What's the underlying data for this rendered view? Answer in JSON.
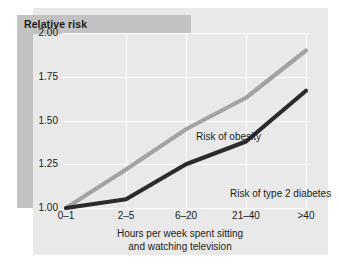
{
  "figure": {
    "title": "Relative risk",
    "background_color": "#ffffff",
    "panel_color": "#e9e9e9",
    "band_color": "#c2c2c2",
    "gridline_color": "#ffffff"
  },
  "chart_data": {
    "type": "line",
    "title": "Relative risk",
    "xlabel": "Hours per week spent sitting and watching television",
    "xlabel_line1": "Hours per week spent sitting",
    "xlabel_line2": "and watching television",
    "ylabel": "Relative risk",
    "categories": [
      "0–1",
      "2–5",
      "6–20",
      "21–40",
      ">40"
    ],
    "ylim": [
      1.0,
      2.0
    ],
    "yticks": [
      1.0,
      1.25,
      1.5,
      1.75,
      2.0
    ],
    "ytick_labels": [
      "1.00",
      "1.25",
      "1.50",
      "1.75",
      "2.00"
    ],
    "grid": true,
    "legend_position": "inline-annotations",
    "series": [
      {
        "name": "Risk of obesity",
        "label": "Risk of obesity",
        "color": "#a3a3a3",
        "values": [
          1.0,
          1.22,
          1.45,
          1.63,
          1.9
        ]
      },
      {
        "name": "Risk of type 2 diabetes",
        "label": "Risk of type 2 diabetes",
        "color": "#2b2b2b",
        "values": [
          1.0,
          1.05,
          1.25,
          1.38,
          1.67
        ]
      }
    ]
  }
}
